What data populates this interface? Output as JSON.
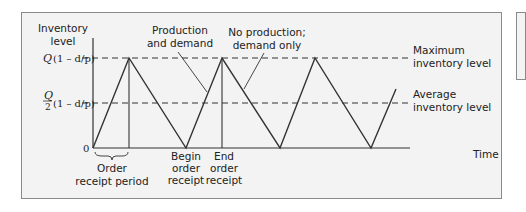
{
  "diagram": {
    "type": "inventory-level-over-time",
    "y_axis_label_line1": "Inventory",
    "y_axis_label_line2": "level",
    "x_axis_label": "Time",
    "y_ticks": {
      "max": {
        "var": "Q",
        "expr": "(1 – d/p)"
      },
      "avg": {
        "numerator": "Q",
        "denominator": "2",
        "expr": "(1 – d/p)"
      },
      "zero": "0"
    },
    "annotations": {
      "production_line1": "Production",
      "production_line2": "and demand",
      "no_production_line1": "No production;",
      "no_production_line2": "demand only",
      "max_line1": "Maximum",
      "max_line2": "inventory level",
      "avg_line1": "Average",
      "avg_line2": "inventory level",
      "order_period_line1": "Order",
      "order_period_line2": "receipt period",
      "begin_line1": "Begin",
      "begin_line2": "order",
      "begin_line3": "receipt",
      "end_line1": "End",
      "end_line2": "order",
      "end_line3": "receipt"
    },
    "sawtooth_points": [
      [
        93,
        148
      ],
      [
        129,
        58
      ],
      [
        186,
        148
      ],
      [
        222,
        58
      ],
      [
        280,
        148
      ],
      [
        315,
        58
      ],
      [
        371,
        148
      ],
      [
        396,
        89
      ]
    ],
    "colors": {
      "line": "#333333",
      "frame_bg": "#f3f3f3",
      "frame_border": "#8a8a8a"
    }
  }
}
